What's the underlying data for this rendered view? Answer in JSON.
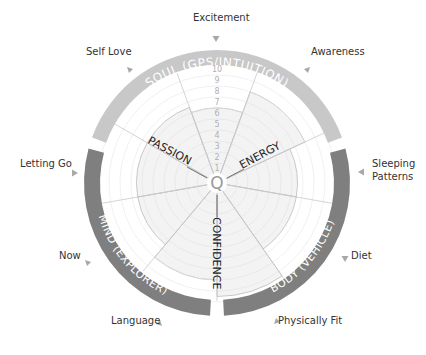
{
  "colors": {
    "soul_ring": "#c8c8c8",
    "mind_ring": "#7f7f7f",
    "body_ring": "#7f7f7f",
    "ring_text": "#ffffff",
    "wedge_fill": "#f1f1f1",
    "wedge_stroke": "#bdbdbd",
    "grid": "#e6e6e6",
    "arrow": "#a8a8a8",
    "label": "#333333",
    "center_q": "#9a9a9a"
  },
  "rings": [
    {
      "id": "soul",
      "label": "SOUL (GPS/INTUITION)",
      "start_deg": -70,
      "end_deg": 70
    },
    {
      "id": "body",
      "label": "BODY (VEHICLE)",
      "start_deg": 75,
      "end_deg": 177
    },
    {
      "id": "mind",
      "label": "MIND (EXPLORER)",
      "start_deg": 183,
      "end_deg": 285
    }
  ],
  "scale": {
    "ticks": [
      "1",
      "2",
      "3",
      "4",
      "5",
      "6",
      "7",
      "8",
      "9",
      "10"
    ]
  },
  "center": {
    "symbol": "Q"
  },
  "axis_labels": [
    {
      "text": "PASSION",
      "angle": -65
    },
    {
      "text": "ENERGY",
      "angle": 65
    },
    {
      "text": "CONFIDENCE",
      "angle": 180
    }
  ],
  "outer_labels": [
    {
      "text": "Excitement",
      "x": 193,
      "y": 22
    },
    {
      "text": "Self Love",
      "x": 86,
      "y": 56
    },
    {
      "text": "Awareness",
      "x": 311,
      "y": 56
    },
    {
      "text": "Letting Go",
      "x": 20,
      "y": 168
    },
    {
      "text": "Sleeping",
      "x": 372,
      "y": 168
    },
    {
      "text": "Patterns",
      "x": 372,
      "y": 181
    },
    {
      "text": "Now",
      "x": 59,
      "y": 260
    },
    {
      "text": "Diet",
      "x": 351,
      "y": 260
    },
    {
      "text": "Language",
      "x": 111,
      "y": 325
    },
    {
      "text": "Physically Fit",
      "x": 278,
      "y": 325
    }
  ],
  "chart_data": {
    "type": "polar-area",
    "title": "",
    "scale_range": [
      0,
      10
    ],
    "categories": [
      "Top (Soul)",
      "Energy",
      "Right (Soul/Body)",
      "Lower Right (Body)",
      "Confidence",
      "Lower Left (Mind)",
      "Left Lower (Mind)",
      "Left Upper (Mind)",
      "Passion"
    ],
    "wedges": [
      {
        "start": -20,
        "end": 20,
        "value": 6
      },
      {
        "start": 20,
        "end": 65,
        "value": 8
      },
      {
        "start": 65,
        "end": 100,
        "value": 6.5
      },
      {
        "start": 100,
        "end": 145,
        "value": 6.5
      },
      {
        "start": 145,
        "end": 180,
        "value": 9.5
      },
      {
        "start": 180,
        "end": 220,
        "value": 8
      },
      {
        "start": 220,
        "end": 260,
        "value": 6.5
      },
      {
        "start": 260,
        "end": 300,
        "value": 6.5
      },
      {
        "start": 300,
        "end": 340,
        "value": 6.5
      }
    ]
  }
}
